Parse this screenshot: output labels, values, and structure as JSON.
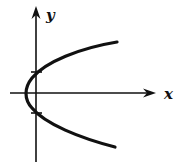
{
  "diagram": {
    "type": "graph",
    "axes": {
      "x_label": "x",
      "y_label": "y"
    },
    "curve": {
      "kind": "parabola",
      "opens": "right",
      "vertex_position": "left of y-axis, on x-axis",
      "y_intercepts": "two marked crossings of the y-axis"
    },
    "colors": {
      "stroke": "#111111",
      "background": "#ffffff"
    }
  }
}
